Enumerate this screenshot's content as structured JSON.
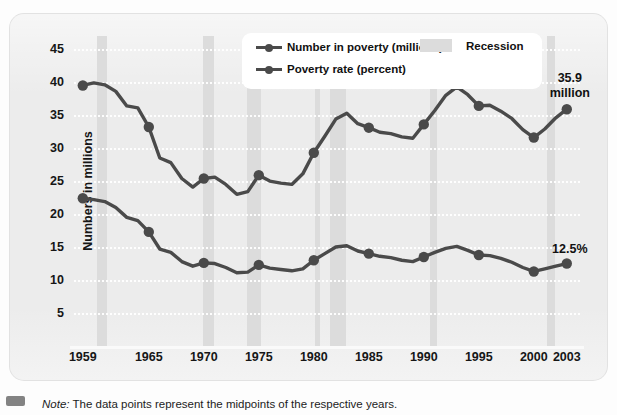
{
  "chart_data": {
    "type": "line",
    "title": "",
    "xlabel": "",
    "ylabel": "Numbers in millions",
    "ylim": [
      0,
      47
    ],
    "xlim": [
      1958.2,
      2004.2
    ],
    "grid": true,
    "yticks": [
      45,
      40,
      35,
      30,
      25,
      20,
      15,
      10,
      5
    ],
    "xticks": [
      1959,
      1965,
      1970,
      1975,
      1980,
      1985,
      1990,
      1995,
      2000,
      2003
    ],
    "legend_position": "top-center",
    "legend": [
      "Number in poverty (millions)",
      "Poverty rate (percent)",
      "Recession"
    ],
    "series": [
      {
        "name": "Number in poverty (millions)",
        "marked_years": [
          1959,
          1965,
          1970,
          1975,
          1980,
          1985,
          1990,
          1995,
          2000,
          2003
        ],
        "x": [
          1959,
          1960,
          1961,
          1962,
          1963,
          1964,
          1965,
          1966,
          1967,
          1968,
          1969,
          1970,
          1971,
          1972,
          1973,
          1974,
          1975,
          1976,
          1977,
          1978,
          1979,
          1980,
          1981,
          1982,
          1983,
          1984,
          1985,
          1986,
          1987,
          1988,
          1989,
          1990,
          1991,
          1992,
          1993,
          1994,
          1995,
          1996,
          1997,
          1998,
          1999,
          2000,
          2001,
          2002,
          2003
        ],
        "y": [
          39.5,
          39.9,
          39.6,
          38.6,
          36.4,
          36.1,
          33.2,
          28.5,
          27.8,
          25.4,
          24.1,
          25.4,
          25.6,
          24.5,
          23.0,
          23.4,
          25.9,
          25.0,
          24.7,
          24.5,
          26.1,
          29.3,
          31.8,
          34.4,
          35.3,
          33.7,
          33.1,
          32.4,
          32.2,
          31.7,
          31.5,
          33.6,
          35.7,
          38.0,
          39.3,
          38.1,
          36.4,
          36.5,
          35.6,
          34.5,
          32.8,
          31.6,
          32.9,
          34.6,
          35.9
        ]
      },
      {
        "name": "Poverty rate (percent)",
        "marked_years": [
          1959,
          1965,
          1970,
          1975,
          1980,
          1985,
          1990,
          1995,
          2000,
          2003
        ],
        "x": [
          1959,
          1960,
          1961,
          1962,
          1963,
          1964,
          1965,
          1966,
          1967,
          1968,
          1969,
          1970,
          1971,
          1972,
          1973,
          1974,
          1975,
          1976,
          1977,
          1978,
          1979,
          1980,
          1981,
          1982,
          1983,
          1984,
          1985,
          1986,
          1987,
          1988,
          1989,
          1990,
          1991,
          1992,
          1993,
          1994,
          1995,
          1996,
          1997,
          1998,
          1999,
          2000,
          2001,
          2002,
          2003
        ],
        "y": [
          22.4,
          22.2,
          21.9,
          21.0,
          19.5,
          19.0,
          17.3,
          14.7,
          14.2,
          12.8,
          12.1,
          12.6,
          12.5,
          11.9,
          11.1,
          11.2,
          12.3,
          11.8,
          11.6,
          11.4,
          11.7,
          13.0,
          14.0,
          15.0,
          15.2,
          14.4,
          14.0,
          13.6,
          13.4,
          13.0,
          12.8,
          13.5,
          14.2,
          14.8,
          15.1,
          14.5,
          13.8,
          13.7,
          13.3,
          12.7,
          11.9,
          11.3,
          11.7,
          12.1,
          12.5
        ]
      }
    ],
    "recessions": [
      {
        "start": 1960.3,
        "end": 1961.2
      },
      {
        "start": 1969.9,
        "end": 1970.9
      },
      {
        "start": 1973.9,
        "end": 1975.2
      },
      {
        "start": 1980.1,
        "end": 1980.6
      },
      {
        "start": 1981.5,
        "end": 1982.9
      },
      {
        "start": 1990.6,
        "end": 1991.2
      },
      {
        "start": 2001.2,
        "end": 2001.9
      }
    ],
    "annotations": [
      {
        "name": "poverty-number-endpoint",
        "lines": [
          "35.9",
          "million"
        ],
        "x": 2003,
        "y": 35.9
      },
      {
        "name": "poverty-rate-endpoint",
        "lines": [
          "12.5%"
        ],
        "x": 2003,
        "y": 12.5
      }
    ],
    "colors": {
      "line": "#4a4a4a",
      "recession_band": "#dcdcdc",
      "panel_background": "#ececec",
      "gridline": "#ffffff",
      "legend_background": "#ffffff"
    }
  },
  "note": {
    "label": "Note:",
    "text": " The data points represent the midpoints of the respective years."
  }
}
